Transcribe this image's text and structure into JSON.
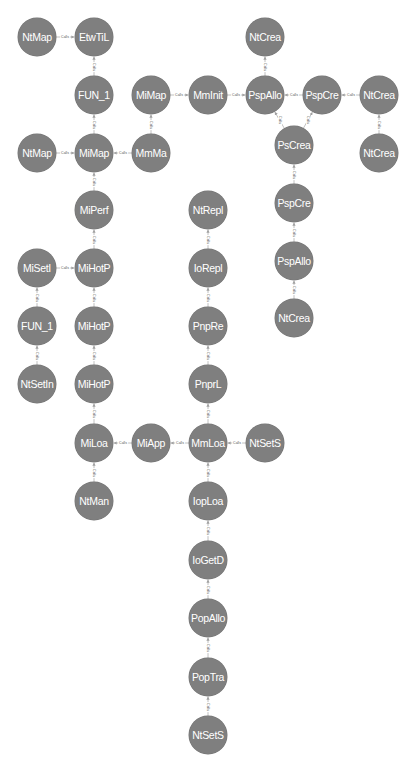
{
  "graph": {
    "node_color": "#7f7f7f",
    "node_text_color": "#ffffff",
    "edge_color": "#b0b0b0",
    "edge_label": "Calls",
    "nodes": [
      {
        "id": "n1",
        "label": "NtMap",
        "x": 37,
        "y": 37
      },
      {
        "id": "n2",
        "label": "EtwTiL",
        "x": 94,
        "y": 37
      },
      {
        "id": "n3",
        "label": "FUN_1",
        "x": 94,
        "y": 95
      },
      {
        "id": "n4",
        "label": "MiMap",
        "x": 151,
        "y": 95
      },
      {
        "id": "n5",
        "label": "MmInit",
        "x": 208,
        "y": 95
      },
      {
        "id": "n6",
        "label": "PspAllo",
        "x": 265,
        "y": 95
      },
      {
        "id": "n7",
        "label": "NtCrea",
        "x": 265,
        "y": 37
      },
      {
        "id": "n8",
        "label": "PspCre",
        "x": 322,
        "y": 95
      },
      {
        "id": "n9",
        "label": "NtCrea",
        "x": 379,
        "y": 95
      },
      {
        "id": "n10",
        "label": "NtCrea",
        "x": 379,
        "y": 153
      },
      {
        "id": "n11",
        "label": "PsCrea",
        "x": 294,
        "y": 145
      },
      {
        "id": "n12",
        "label": "NtMap",
        "x": 37,
        "y": 153
      },
      {
        "id": "n13",
        "label": "MiMap",
        "x": 94,
        "y": 153
      },
      {
        "id": "n14",
        "label": "MmMa",
        "x": 151,
        "y": 153
      },
      {
        "id": "n15",
        "label": "MiPerf",
        "x": 94,
        "y": 210
      },
      {
        "id": "n16",
        "label": "PspCre",
        "x": 294,
        "y": 203
      },
      {
        "id": "n17",
        "label": "NtRepl",
        "x": 208,
        "y": 210
      },
      {
        "id": "n18",
        "label": "PspAllo",
        "x": 294,
        "y": 261
      },
      {
        "id": "n19",
        "label": "MiSetI",
        "x": 37,
        "y": 268
      },
      {
        "id": "n20",
        "label": "MiHotP",
        "x": 94,
        "y": 268
      },
      {
        "id": "n21",
        "label": "IoRepl",
        "x": 208,
        "y": 268
      },
      {
        "id": "n22",
        "label": "NtCrea",
        "x": 294,
        "y": 318
      },
      {
        "id": "n23",
        "label": "FUN_1",
        "x": 37,
        "y": 326
      },
      {
        "id": "n24",
        "label": "MiHotP",
        "x": 94,
        "y": 326
      },
      {
        "id": "n25",
        "label": "PnpRe",
        "x": 208,
        "y": 326
      },
      {
        "id": "n26",
        "label": "NtSetIn",
        "x": 37,
        "y": 384
      },
      {
        "id": "n27",
        "label": "MiHotP",
        "x": 94,
        "y": 384
      },
      {
        "id": "n28",
        "label": "PnprL",
        "x": 208,
        "y": 384
      },
      {
        "id": "n29",
        "label": "MiLoa",
        "x": 94,
        "y": 443
      },
      {
        "id": "n30",
        "label": "MiApp",
        "x": 151,
        "y": 443
      },
      {
        "id": "n31",
        "label": "MmLoa",
        "x": 208,
        "y": 443
      },
      {
        "id": "n32",
        "label": "NtSetS",
        "x": 265,
        "y": 443
      },
      {
        "id": "n33",
        "label": "NtMan",
        "x": 94,
        "y": 501
      },
      {
        "id": "n34",
        "label": "IopLoa",
        "x": 208,
        "y": 501
      },
      {
        "id": "n35",
        "label": "IoGetD",
        "x": 208,
        "y": 560
      },
      {
        "id": "n36",
        "label": "PopAllo",
        "x": 208,
        "y": 618
      },
      {
        "id": "n37",
        "label": "PopTra",
        "x": 208,
        "y": 677
      },
      {
        "id": "n38",
        "label": "NtSetS",
        "x": 208,
        "y": 735
      }
    ],
    "edges": [
      {
        "from": "n1",
        "to": "n2"
      },
      {
        "from": "n3",
        "to": "n2"
      },
      {
        "from": "n4",
        "to": "n5"
      },
      {
        "from": "n5",
        "to": "n6"
      },
      {
        "from": "n6",
        "to": "n7"
      },
      {
        "from": "n8",
        "to": "n6"
      },
      {
        "from": "n9",
        "to": "n8"
      },
      {
        "from": "n10",
        "to": "n9"
      },
      {
        "from": "n11",
        "to": "n6"
      },
      {
        "from": "n11",
        "to": "n8"
      },
      {
        "from": "n14",
        "to": "n4"
      },
      {
        "from": "n12",
        "to": "n13"
      },
      {
        "from": "n13",
        "to": "n3"
      },
      {
        "from": "n14",
        "to": "n13"
      },
      {
        "from": "n15",
        "to": "n13"
      },
      {
        "from": "n16",
        "to": "n11"
      },
      {
        "from": "n18",
        "to": "n16"
      },
      {
        "from": "n22",
        "to": "n18"
      },
      {
        "from": "n20",
        "to": "n15"
      },
      {
        "from": "n19",
        "to": "n20"
      },
      {
        "from": "n23",
        "to": "n19"
      },
      {
        "from": "n26",
        "to": "n23"
      },
      {
        "from": "n24",
        "to": "n20"
      },
      {
        "from": "n27",
        "to": "n24"
      },
      {
        "from": "n29",
        "to": "n27"
      },
      {
        "from": "n33",
        "to": "n29"
      },
      {
        "from": "n30",
        "to": "n29"
      },
      {
        "from": "n31",
        "to": "n30"
      },
      {
        "from": "n32",
        "to": "n31"
      },
      {
        "from": "n21",
        "to": "n17"
      },
      {
        "from": "n25",
        "to": "n21"
      },
      {
        "from": "n28",
        "to": "n25"
      },
      {
        "from": "n31",
        "to": "n28"
      },
      {
        "from": "n34",
        "to": "n31"
      },
      {
        "from": "n35",
        "to": "n34"
      },
      {
        "from": "n36",
        "to": "n35"
      },
      {
        "from": "n37",
        "to": "n36"
      },
      {
        "from": "n38",
        "to": "n37"
      }
    ]
  }
}
